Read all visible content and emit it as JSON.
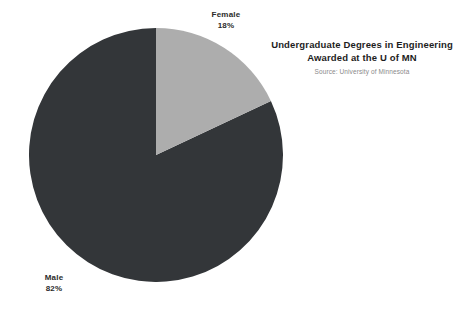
{
  "chart_data": {
    "type": "pie",
    "title": "Undergraduate Degrees in Engineering Awarded at the U of MN",
    "title_lines": [
      "Undergraduate Degrees in Engineering",
      "Awarded at the U of MN"
    ],
    "source": "Source: University of Minnesota",
    "categories": [
      "Female",
      "Male"
    ],
    "values": [
      18,
      82
    ],
    "unit": "%",
    "labels": [
      "18%",
      "82%"
    ],
    "colors": [
      "#adadad",
      "#333639"
    ],
    "start_angle_deg": 0,
    "direction": "clockwise",
    "legend": "none",
    "grid": false,
    "slices": [
      {
        "name": "Female",
        "value": 18,
        "value_label": "18%",
        "color": "#adadad",
        "start_angle_deg": 0,
        "sweep_angle_deg": 64.8
      },
      {
        "name": "Male",
        "value": 82,
        "value_label": "82%",
        "color": "#333639",
        "start_angle_deg": 64.8,
        "sweep_angle_deg": 295.2
      }
    ]
  },
  "colors": {
    "background": "#ffffff",
    "female_slice": "#adadad",
    "male_slice": "#333639",
    "title_text": "#1d1d1d",
    "source_text": "#8a8a8a",
    "label_text": "#2b2b2b"
  }
}
